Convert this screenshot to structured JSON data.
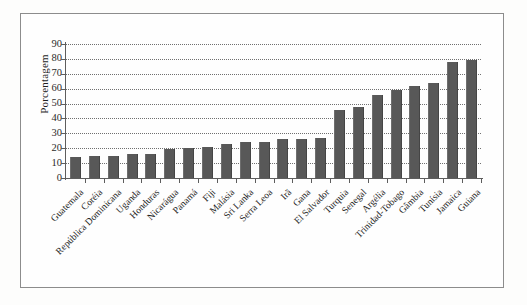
{
  "figure": {
    "frame_border_color": "#8c8c8c",
    "background_color": "#fefefe",
    "bar_color": "#585858",
    "axis_color": "#5d5d5d"
  },
  "chart_data": {
    "type": "bar",
    "title": "",
    "xlabel": "",
    "ylabel": "Porcentagem",
    "ylim": [
      0,
      90
    ],
    "ytick_step": 10,
    "yticks": [
      "0",
      "10",
      "20",
      "30",
      "40",
      "50",
      "60",
      "70",
      "80",
      "90"
    ],
    "grid": "horizontal-dotted",
    "legend": "none",
    "orientation": "vertical",
    "categories": [
      "Guatemala",
      "Coréia",
      "República Dominicana",
      "Uganda",
      "Honduras",
      "Nicarágua",
      "Panamá",
      "Fiji",
      "Malásia",
      "Sri Lanka",
      "Serra Leoa",
      "Irã",
      "Gana",
      "El Salvador",
      "Turquia",
      "Senegal",
      "Argélia",
      "Trinidad-Tobago",
      "Gâmbia",
      "Tunísia",
      "Jamaica",
      "Guiana"
    ],
    "values": [
      14,
      15,
      15,
      16,
      16,
      19.5,
      20,
      21,
      23,
      24.5,
      24.5,
      26.5,
      26.5,
      27,
      46,
      48,
      55.5,
      59,
      62,
      64,
      78,
      79
    ]
  }
}
